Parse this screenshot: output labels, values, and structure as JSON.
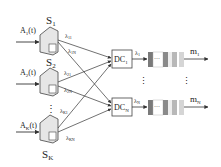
{
  "servers": [
    {
      "label": "S",
      "sub": "1",
      "input": "A",
      "input_sub": "1",
      "input_arg": "(t)",
      "rates": [
        {
          "l": "λ",
          "s": "11"
        },
        {
          "l": "λ",
          "s": "1N"
        }
      ]
    },
    {
      "label": "S",
      "sub": "2",
      "input": "A",
      "input_sub": "2",
      "input_arg": "(t)",
      "rates": [
        {
          "l": "λ",
          "s": "21"
        },
        {
          "l": "λ",
          "s": "2N"
        }
      ]
    },
    {
      "label": "S",
      "sub": "K",
      "input": "A",
      "input_sub": "K",
      "input_arg": "(t)",
      "rates": [
        {
          "l": "λ",
          "s": "K1"
        },
        {
          "l": "λ",
          "s": "KN"
        }
      ]
    }
  ],
  "dispatchers": [
    {
      "label": "DC",
      "sub": "1",
      "rate": "λ",
      "rate_sub": "1",
      "out": "m",
      "out_sub": "1"
    },
    {
      "label": "DC",
      "sub": "N",
      "rate": "λ",
      "rate_sub": "N",
      "out": "m",
      "out_sub": "N"
    }
  ],
  "ellipsis": "⋮",
  "queue_ellipsis": "···",
  "colors": {
    "line": "#333333",
    "queue_dark": "#7a7a7a",
    "queue_mid": "#b5b5b5",
    "queue_light": "#dcdcdc",
    "server": "#e8e8e8"
  }
}
